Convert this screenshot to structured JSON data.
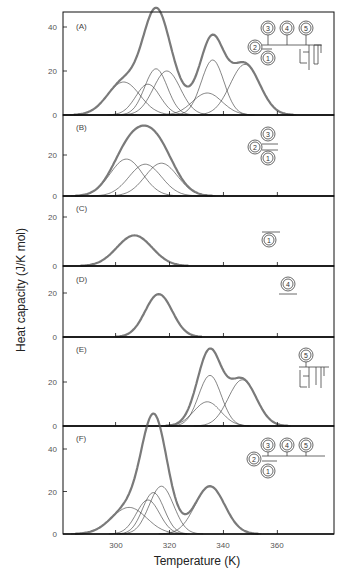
{
  "chart_data": {
    "type": "line",
    "xlabel": "Temperature (K)",
    "ylabel": "Heat capacity (J/K mol)",
    "x_ticks": [
      300,
      320,
      340,
      360
    ],
    "xlim": [
      280.5,
      381
    ],
    "grid": false,
    "colors": {
      "total": "#7a7a7a",
      "component": "#333333",
      "axis": "#111111"
    },
    "panels": [
      {
        "label": "(A)",
        "y_ticks": [
          0,
          20,
          40
        ],
        "ylim": [
          0,
          47
        ],
        "icon": "domains-1-2-3-4-5-with-linker",
        "components": [
          {
            "center": 303,
            "height": 15,
            "sigma": 6.0
          },
          {
            "center": 312,
            "height": 14,
            "sigma": 4.5
          },
          {
            "center": 315,
            "height": 21,
            "sigma": 4.2
          },
          {
            "center": 319,
            "height": 20,
            "sigma": 5.0
          },
          {
            "center": 334,
            "height": 10,
            "sigma": 5.5
          },
          {
            "center": 336,
            "height": 25,
            "sigma": 4.2
          },
          {
            "center": 348,
            "height": 23,
            "sigma": 5.5
          }
        ],
        "total_features": {
          "peak1": {
            "x": 313,
            "y": 41
          },
          "valley": {
            "x": 326,
            "y": 16
          },
          "peak2": {
            "x": 336,
            "y": 38
          },
          "shoulder": {
            "x": 348,
            "y": 24
          }
        }
      },
      {
        "label": "(B)",
        "y_ticks": [
          0,
          20
        ],
        "ylim": [
          0,
          37
        ],
        "icon": "domains-1-2-3",
        "components": [
          {
            "center": 304,
            "height": 18,
            "sigma": 6.0
          },
          {
            "center": 311,
            "height": 15.5,
            "sigma": 6.0
          },
          {
            "center": 317,
            "height": 16,
            "sigma": 6.0
          }
        ],
        "total_features": {
          "peak": {
            "x": 312,
            "y": 31
          }
        }
      },
      {
        "label": "(C)",
        "y_ticks": [
          0,
          20
        ],
        "ylim": [
          0,
          28
        ],
        "icon": "domain-1",
        "components": [
          {
            "center": 307,
            "height": 12.5,
            "sigma": 6.5
          }
        ],
        "total_features": {
          "peak": {
            "x": 307,
            "y": 12.5
          }
        }
      },
      {
        "label": "(D)",
        "y_ticks": [
          0,
          20
        ],
        "ylim": [
          0,
          33
        ],
        "icon": "domain-4",
        "components": [
          {
            "center": 316,
            "height": 19.5,
            "sigma": 5.0
          }
        ],
        "total_features": {
          "peak": {
            "x": 316,
            "y": 19.5
          }
        }
      },
      {
        "label": "(E)",
        "y_ticks": [
          0,
          20
        ],
        "ylim": [
          0,
          41
        ],
        "icon": "domain-5-with-linker",
        "components": [
          {
            "center": 334,
            "height": 11,
            "sigma": 5.0
          },
          {
            "center": 335,
            "height": 23,
            "sigma": 4.2
          },
          {
            "center": 347,
            "height": 21,
            "sigma": 5.2
          }
        ],
        "total_features": {
          "peak": {
            "x": 335,
            "y": 37
          },
          "shoulder": {
            "x": 347,
            "y": 23
          }
        }
      },
      {
        "label": "(F)",
        "y_ticks": [
          0,
          20,
          40
        ],
        "ylim": [
          0,
          49
        ],
        "icon": "domains-1-2-3-4-5",
        "components": [
          {
            "center": 305,
            "height": 12.5,
            "sigma": 6.5
          },
          {
            "center": 312,
            "height": 16,
            "sigma": 4.3
          },
          {
            "center": 314,
            "height": 19.5,
            "sigma": 4.0
          },
          {
            "center": 317,
            "height": 22.5,
            "sigma": 4.5
          },
          {
            "center": 335,
            "height": 22.5,
            "sigma": 5.5
          }
        ],
        "total_features": {
          "peak1": {
            "x": 313,
            "y": 46
          },
          "valley": {
            "x": 326,
            "y": 17
          },
          "peak2": {
            "x": 334,
            "y": 24
          }
        }
      }
    ]
  },
  "labels": {
    "xlabel": "Temperature (K)",
    "ylabel": "Heat capacity (J/K mol)",
    "panel_A": "(A)",
    "panel_B": "(B)",
    "panel_C": "(C)",
    "panel_D": "(D)",
    "panel_E": "(E)",
    "panel_F": "(F)",
    "x_tick_300": "300",
    "x_tick_320": "320",
    "x_tick_340": "340",
    "x_tick_360": "360"
  },
  "icons": {
    "domain_numbers": [
      "1",
      "2",
      "3",
      "4",
      "5"
    ]
  }
}
